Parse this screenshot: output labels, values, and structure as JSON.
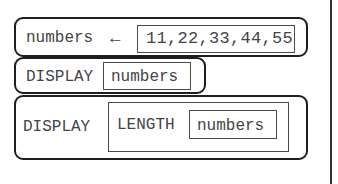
{
  "diagram": {
    "type": "block-pseudocode",
    "blocks": [
      {
        "kind": "assignment",
        "variable": "numbers",
        "operator": "←",
        "value": "11,22,33,44,55"
      },
      {
        "kind": "display",
        "keyword": "DISPLAY",
        "argument": "numbers"
      },
      {
        "kind": "display",
        "keyword": "DISPLAY",
        "argument": {
          "function": "LENGTH",
          "argument": "numbers"
        }
      }
    ]
  },
  "colors": {
    "block_border": "#1e1e1e",
    "box_border": "#4a4a4a",
    "text": "#444444",
    "background": "#ffffff"
  }
}
